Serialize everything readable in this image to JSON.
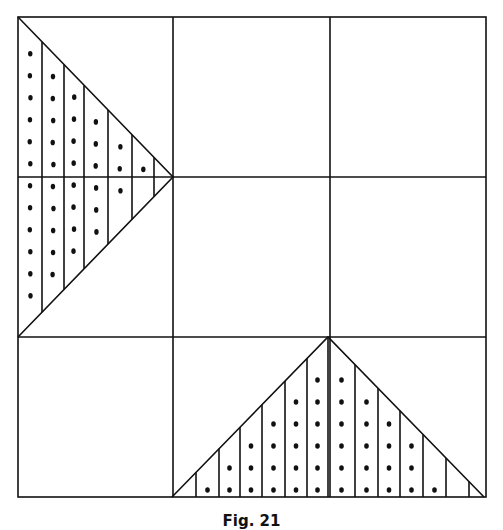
{
  "figure": {
    "caption": "Fig. 21",
    "grid": {
      "rows": 3,
      "columns": 3
    },
    "shapes": [
      {
        "name": "left-shaded-triangle",
        "fill": "vertical stripes with dots",
        "points": [
          [
            18,
            17
          ],
          [
            173,
            177
          ],
          [
            18,
            337
          ]
        ]
      },
      {
        "name": "bottom-shaded-triangle",
        "fill": "vertical stripes with dots",
        "points": [
          [
            172,
            497
          ],
          [
            328,
            337
          ],
          [
            484,
            497
          ]
        ]
      }
    ],
    "colors": {
      "line": "#111111",
      "background": "#ffffff"
    }
  }
}
